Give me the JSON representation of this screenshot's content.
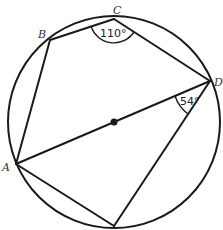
{
  "diagram": {
    "type": "circle-geometry",
    "stroke_color": "#1a1a1a",
    "background": "#ffffff",
    "circle": {
      "center": [
        114,
        122
      ],
      "radius": 106
    },
    "points": {
      "A": {
        "label": "A",
        "x": 16,
        "y": 164
      },
      "B": {
        "label": "B",
        "x": 50,
        "y": 40
      },
      "C": {
        "label": "C",
        "x": 114,
        "y": 19
      },
      "D": {
        "label": "D",
        "x": 210,
        "y": 81
      },
      "E": {
        "label": "",
        "x": 114,
        "y": 226
      },
      "O": {
        "label": "",
        "x": 114,
        "y": 122
      }
    },
    "segments": [
      "AB",
      "BC",
      "CD",
      "DA",
      "AE",
      "DE"
    ],
    "angles": {
      "C": {
        "value": "110°"
      },
      "D": {
        "value": "54°"
      }
    }
  }
}
